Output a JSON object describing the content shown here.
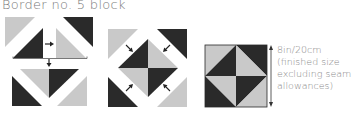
{
  "title": "Border no. 5 block",
  "colors": {
    "light": "#c9c9c9",
    "dark": "#2a2a2a",
    "arrow": "#222222",
    "text": "#7a7a7a",
    "background": "#ffffff"
  },
  "steps": [
    {
      "name": "step-1",
      "description": "Join half-square triangles in pairs, then join pairs"
    },
    {
      "name": "step-2",
      "description": "Add corner triangles around central square-in-square"
    },
    {
      "name": "step-3",
      "description": "Finished block"
    }
  ],
  "dimension_note": {
    "lines": [
      "8in/20cm",
      "(finished size",
      "excluding seam",
      "allowances)"
    ]
  }
}
